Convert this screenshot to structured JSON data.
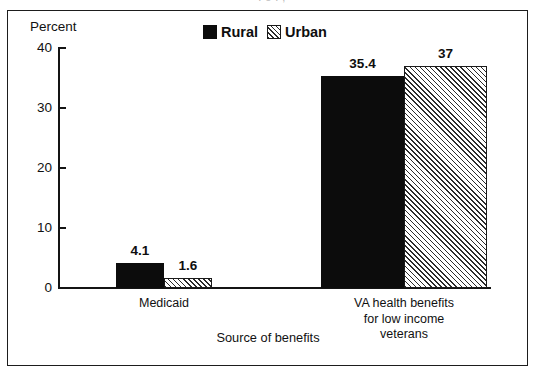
{
  "scan": {
    "cut_top_text": ". o . ,"
  },
  "chart_data": {
    "type": "bar",
    "title": "",
    "subtitle": "",
    "xlabel": "Source of benefits",
    "ylabel": "Percent",
    "ylim": [
      0,
      40
    ],
    "yticks": [
      0,
      10,
      20,
      30,
      40
    ],
    "ytick_labels": [
      "0",
      "10",
      "20",
      "30",
      "40"
    ],
    "grid": false,
    "legend_position": "top-center",
    "categories": [
      "Medicaid",
      "VA health benefits\nfor low income\nveterans"
    ],
    "category_labels_flat": [
      "Medicaid",
      "VA health benefits for low income veterans"
    ],
    "series": [
      {
        "name": "Rural",
        "fill": "solid-black",
        "color": "#0c0c0c",
        "values": [
          4.1,
          35.4
        ],
        "value_labels": [
          "4.1",
          "35.4"
        ]
      },
      {
        "name": "Urban",
        "fill": "diagonal-hatch",
        "color": "#2b2b2b",
        "values": [
          1.6,
          37
        ],
        "value_labels": [
          "1.6",
          "37"
        ]
      }
    ]
  },
  "legend": {
    "items": [
      {
        "label": "Rural",
        "swatch": "solid-swatch"
      },
      {
        "label": "Urban",
        "swatch": "hatched-swatch"
      }
    ]
  }
}
